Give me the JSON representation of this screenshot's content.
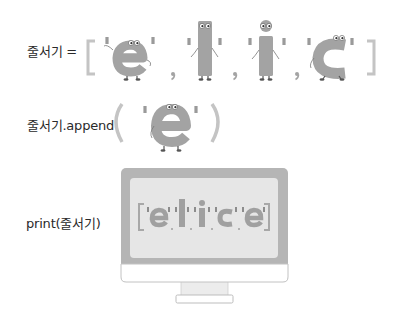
{
  "lines": [
    {
      "code_label": "줄서기 =",
      "kind": "assignment",
      "list": [
        "e",
        "l",
        "i",
        "c"
      ],
      "open": "[",
      "close": "]"
    },
    {
      "code_label": "줄서기.append",
      "kind": "method-call",
      "argument": "e",
      "open": "(",
      "close": ")"
    },
    {
      "code_label": "print(줄서기)",
      "kind": "print",
      "output_list": [
        "e",
        "l",
        "i",
        "c",
        "e"
      ],
      "open": "[",
      "close": "]"
    }
  ],
  "colors": {
    "character_fill": "#a3a3a3",
    "character_dark": "#8e8e8e",
    "bracket": "#c4c4c4",
    "quote": "#9a9a9a",
    "monitor_frame": "#b5b5b5",
    "monitor_screen": "#e6e6e6",
    "monitor_chin": "#ffffff",
    "text": "#2a2a2a"
  },
  "separator": ","
}
